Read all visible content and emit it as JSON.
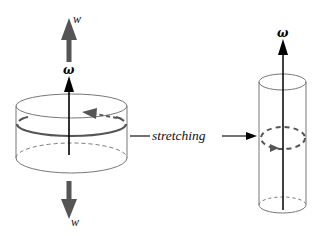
{
  "figure": {
    "left_cylinder": {
      "omega_label": "ω",
      "top_arrow_label": "w",
      "bottom_arrow_label": "w"
    },
    "process_label": "stretching",
    "right_cylinder": {
      "omega_label": "ω"
    },
    "colors": {
      "outline": "#777777",
      "axis_arrow": "#000000",
      "force_arrow": "#555555",
      "vortex_ring": "#555555"
    }
  }
}
